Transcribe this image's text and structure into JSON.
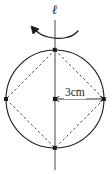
{
  "figure": {
    "type": "geometry-diagram",
    "background_color": "#ffffff",
    "stroke_color": "#1a1a1a",
    "dashed_color": "#555555",
    "axis": {
      "label": "ℓ",
      "name": "rotation-axis",
      "orientation": "vertical",
      "x": 55,
      "y_top": 20,
      "y_bottom": 170
    },
    "rotation_arrow": {
      "name": "rotation-arrow",
      "direction": "counterclockwise",
      "arrowhead_position": "upper-left"
    },
    "circle": {
      "center_x": 55,
      "center_y": 99,
      "radius": 49
    },
    "center_point": {
      "label": "",
      "x": 55,
      "y": 99
    },
    "rhombus_vertices": [
      {
        "name": "top",
        "x": 55,
        "y": 50
      },
      {
        "name": "right",
        "x": 104,
        "y": 99
      },
      {
        "name": "bottom",
        "x": 55,
        "y": 148
      },
      {
        "name": "left",
        "x": 6,
        "y": 99
      }
    ],
    "dimension": {
      "name": "radius-dimension",
      "label": "3cm",
      "value": 3,
      "unit": "cm",
      "from_x": 55,
      "to_x": 104,
      "y": 99
    }
  }
}
